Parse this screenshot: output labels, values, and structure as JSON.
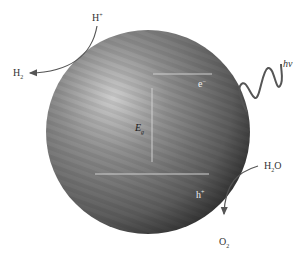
{
  "diagram": {
    "type": "photocatalysis-particle",
    "particle": {
      "color_light": "#c9c9c9",
      "color_mid": "#7a7a7a",
      "color_dark": "#2a2a2a"
    },
    "labels": {
      "proton": {
        "base": "H",
        "sup": "+"
      },
      "hydrogen": {
        "base": "H",
        "sub": "2"
      },
      "photon": "hv",
      "electron": {
        "base": "e",
        "sup": "−"
      },
      "band_gap": {
        "base": "E",
        "sub": "g"
      },
      "hole": {
        "base": "h",
        "sup": "+"
      },
      "water": {
        "base": "H",
        "sub": "2",
        "tail": "O"
      },
      "oxygen": {
        "base": "O",
        "sub": "2"
      }
    },
    "arrows": [
      {
        "from": "H+",
        "to": "H2",
        "via": "particle-surface"
      },
      {
        "from": "H2O",
        "to": "O2",
        "via": "particle-surface"
      }
    ],
    "levels": [
      "conduction-band",
      "valence-band"
    ]
  }
}
